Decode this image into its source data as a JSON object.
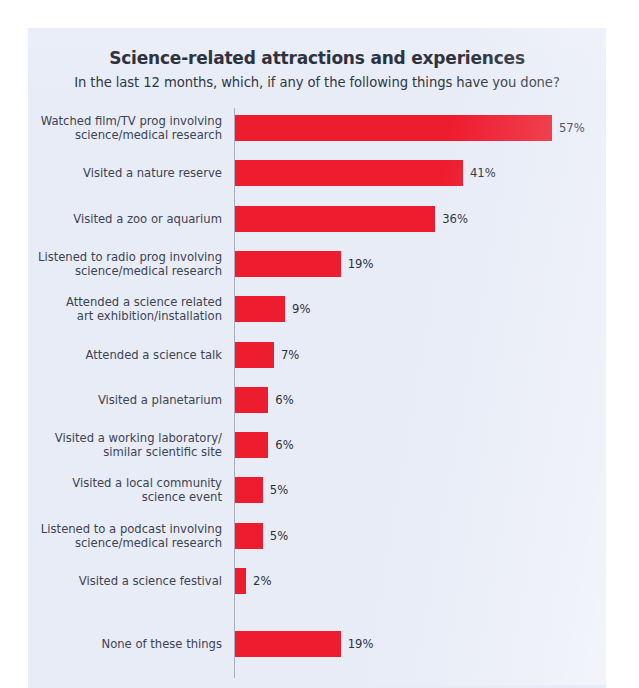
{
  "chart_data": {
    "type": "bar",
    "orientation": "horizontal",
    "title": "Science-related attractions and experiences",
    "subtitle": "In the last 12 months, which, if any of the following things have you done?",
    "xlabel": "",
    "ylabel": "",
    "xlim": [
      0,
      57
    ],
    "grid": false,
    "legend": null,
    "value_suffix": "%",
    "bar_color": "#ed1c2e",
    "panel_color": "#e8ecf7",
    "categories": [
      "Watched film/TV prog involving\nscience/medical research",
      "Visited a nature reserve",
      "Visited a zoo or aquarium",
      "Listened to radio prog involving\nscience/medical research",
      "Attended a science related\nart exhibition/installation",
      "Attended a science talk",
      "Visited a planetarium",
      "Visited a working laboratory/\nsimilar scientific site",
      "Visited a local community\nscience event",
      "Listened to a podcast involving\nscience/medical research",
      "Visited a science festival",
      "None of these things"
    ],
    "values": [
      57,
      41,
      36,
      19,
      9,
      7,
      6,
      6,
      5,
      5,
      2,
      19
    ],
    "data_labels": [
      "57%",
      "41%",
      "36%",
      "19%",
      "9%",
      "7%",
      "6%",
      "6%",
      "5%",
      "5%",
      "2%",
      "19%"
    ]
  }
}
